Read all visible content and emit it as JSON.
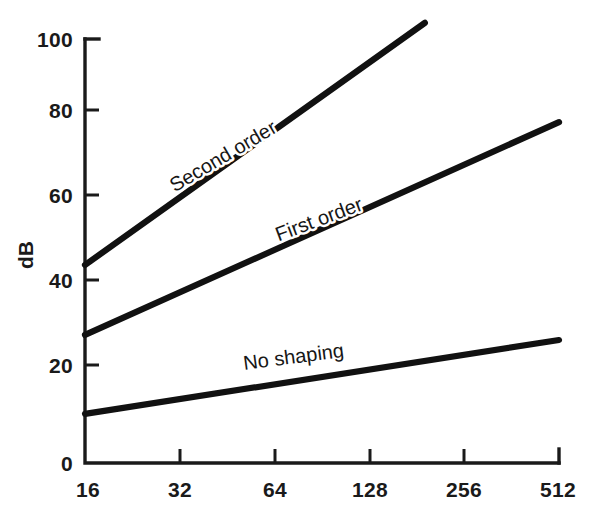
{
  "chart_data": {
    "type": "line",
    "title": "",
    "subtitle": "",
    "xlabel": "",
    "ylabel": "dB",
    "xscale": "log2",
    "xlim": [
      16,
      512
    ],
    "ylim": [
      0,
      100
    ],
    "grid": false,
    "legend_position": "inline-on-curve",
    "x_ticks": [
      "16",
      "32",
      "64",
      "128",
      "256",
      "512"
    ],
    "x_tick_values": [
      16,
      32,
      64,
      128,
      256,
      512
    ],
    "y_ticks": [
      "0",
      "20",
      "40",
      "60",
      "80",
      "100"
    ],
    "y_tick_values": [
      0,
      20,
      40,
      60,
      80,
      100
    ],
    "series": [
      {
        "name": "Second order",
        "label": "Second order",
        "color": "#111111",
        "x": [
          16,
          192
        ],
        "values": [
          46.7,
          103.8
        ],
        "slope_db_per_octave": 15.0,
        "label_x": 45,
        "label_y": 71,
        "label_rotation": -30.5
      },
      {
        "name": "First order",
        "label": "First order",
        "color": "#111111",
        "x": [
          16,
          512
        ],
        "values": [
          30.2,
          80.4
        ],
        "slope_db_per_octave": 10.0,
        "label_x": 90,
        "label_y": 56,
        "label_rotation": -20.5
      },
      {
        "name": "No shaping",
        "label": "No shaping",
        "color": "#111111",
        "x": [
          16,
          512
        ],
        "values": [
          11.6,
          29.0
        ],
        "slope_db_per_octave": 3.5,
        "label_x": 74,
        "label_y": 23.5,
        "label_rotation": -7.5
      }
    ]
  },
  "axes": {
    "y_axis_title": "dB",
    "x_axis_title": ""
  },
  "colors": {
    "background": "#ffffff",
    "ink": "#1a1a1a",
    "curve": "#111111"
  }
}
